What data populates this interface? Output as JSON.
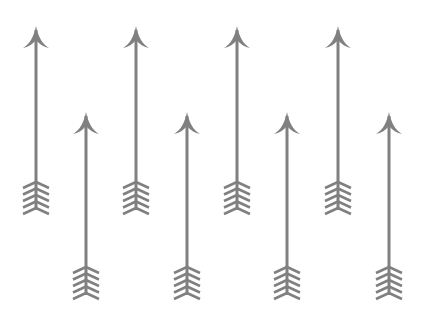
{
  "image": {
    "description": "Pattern of eight gray upward-pointing arrows with curved arrowheads and chevron fletching, arranged in two staggered rows",
    "background": "#ffffff",
    "arrow_color": "#808080",
    "arrows": [
      {
        "row": "top",
        "x": 36,
        "tip_y": 26,
        "tail_y": 212
      },
      {
        "row": "bottom",
        "x": 86,
        "tip_y": 112,
        "tail_y": 297
      },
      {
        "row": "top",
        "x": 136,
        "tip_y": 26,
        "tail_y": 212
      },
      {
        "row": "bottom",
        "x": 187,
        "tip_y": 112,
        "tail_y": 297
      },
      {
        "row": "top",
        "x": 237,
        "tip_y": 26,
        "tail_y": 212
      },
      {
        "row": "bottom",
        "x": 287,
        "tip_y": 112,
        "tail_y": 297
      },
      {
        "row": "top",
        "x": 338,
        "tip_y": 26,
        "tail_y": 212
      },
      {
        "row": "bottom",
        "x": 389,
        "tip_y": 112,
        "tail_y": 297
      }
    ],
    "fletching_chevrons": 5
  }
}
